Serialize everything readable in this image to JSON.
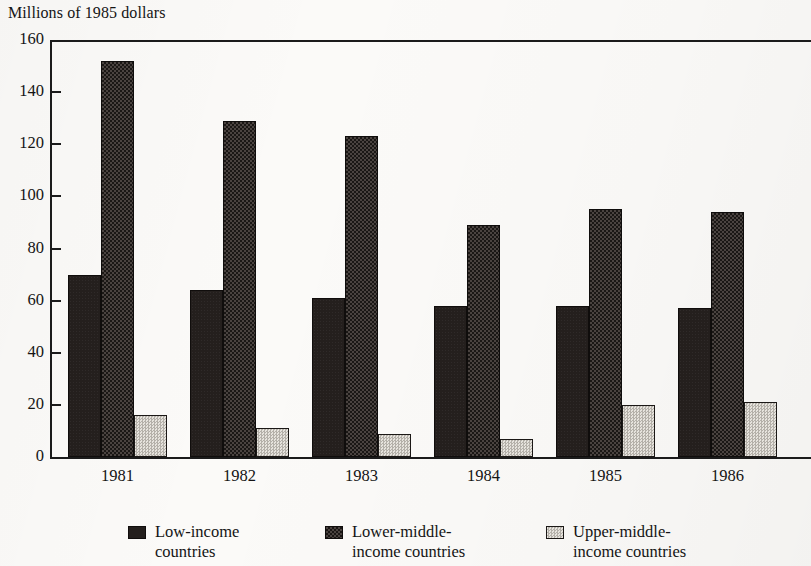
{
  "chart_data": {
    "type": "bar",
    "title": "Millions of 1985 dollars",
    "xlabel": "",
    "ylabel": "Millions of 1985 dollars",
    "categories": [
      "1981",
      "1982",
      "1983",
      "1984",
      "1985",
      "1986"
    ],
    "series": [
      {
        "name": "Low-income\ncountries",
        "legend_label": "Low-income countries",
        "values": [
          70,
          64,
          61,
          58,
          58,
          57
        ],
        "pattern": "solid-dark",
        "color": "#241f1d"
      },
      {
        "name": "Lower-middle-\nincome countries",
        "legend_label": "Lower-middle-income countries",
        "values": [
          152,
          129,
          123,
          89,
          95,
          94
        ],
        "pattern": "dark-checker",
        "color": "#2f2a27"
      },
      {
        "name": "Upper-middle-\nincome countries",
        "legend_label": "Upper-middle-income countries",
        "values": [
          16,
          11,
          9,
          7,
          20,
          21
        ],
        "pattern": "light-checker",
        "color": "#cfccc6"
      }
    ],
    "ylim": [
      0,
      160
    ],
    "yticks": [
      0,
      20,
      40,
      60,
      80,
      100,
      120,
      140,
      160
    ],
    "ytick_labels": [
      "0",
      "20",
      "40",
      "60",
      "80",
      "100",
      "120",
      "140",
      "160"
    ],
    "grid": false,
    "legend_position": "bottom"
  },
  "legend": {
    "items": [
      {
        "label": "Low-income\ncountries",
        "swatch": "solid-dark-swatch"
      },
      {
        "label": "Lower-middle-\nincome countries",
        "swatch": "dark-checker-swatch"
      },
      {
        "label": "Upper-middle-\nincome countries",
        "swatch": "light-checker-swatch"
      }
    ]
  }
}
